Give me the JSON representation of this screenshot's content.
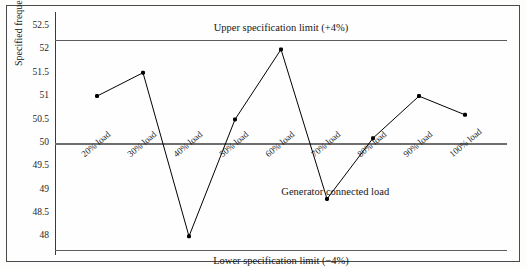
{
  "chart_data": {
    "type": "line",
    "title": "",
    "subtitle": "",
    "xlabel": "Generator connected load",
    "ylabel": "Specified frequency (Hz)",
    "categories": [
      "20% load",
      "30% load",
      "40% load",
      "50% load",
      "60% load",
      "70% load",
      "80% load",
      "90% load",
      "100% load"
    ],
    "series": [
      {
        "name": "Specified frequency",
        "values": [
          51.0,
          51.5,
          48.0,
          50.5,
          52.0,
          48.8,
          50.1,
          51.0,
          50.6
        ]
      }
    ],
    "ylim": [
      47.6,
      52.8
    ],
    "yticks": [
      "52.5",
      "52",
      "51.5",
      "51",
      "50.5",
      "50",
      "49.5",
      "49",
      "48.5",
      "48"
    ],
    "ytick_values": [
      52.5,
      52,
      51.5,
      51,
      50.5,
      50,
      49.5,
      49,
      48.5,
      48
    ],
    "grid": false,
    "legend": "none",
    "reference_lines": [
      {
        "label": "Upper specification limit (+4%)",
        "value": 52.2
      },
      {
        "label": "",
        "value": 50.0
      },
      {
        "label": "Lower specification limit (−4%)",
        "value": 47.7
      }
    ],
    "colors": {
      "series_line": "#000000",
      "marker": "#000000",
      "reference_line": "#5c5c5c",
      "axis": "#3a3a3a",
      "background": "#fefefe",
      "text": "#171717"
    }
  },
  "annotations": {
    "upper_limit": "Upper specification limit (+4%)",
    "lower_limit": "Lower specification limit (−4%)",
    "x_axis_inner": "Generator connected load"
  },
  "axes": {
    "y_title": "Specified frequency (Hz)"
  }
}
